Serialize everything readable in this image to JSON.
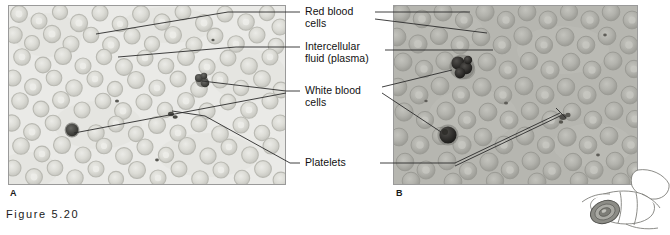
{
  "figure": {
    "caption": "Figure 5.20",
    "panels": [
      {
        "id": "A",
        "letter": "A",
        "description": "blood smear low magnification"
      },
      {
        "id": "B",
        "letter": "B",
        "description": "blood smear high magnification"
      }
    ]
  },
  "labels": [
    {
      "id": "red-blood-cells",
      "text": "Red blood\ncells"
    },
    {
      "id": "intercellular-fluid",
      "text": "Intercellular\nfluid (plasma)"
    },
    {
      "id": "white-blood-cells",
      "text": "White blood\ncells"
    },
    {
      "id": "platelets",
      "text": "Platelets"
    }
  ],
  "colors": {
    "panel_a_background": "#e9e9e6",
    "panel_a_cell": "#cfcfc9",
    "panel_b_background": "#b8b8b2",
    "panel_b_cell": "#a6a6a0",
    "dark_cell": "#3a3a38",
    "leader_line": "#2b2b2b",
    "frame": "#9a9a9a",
    "text": "#111111",
    "caption": "#1a1a1a"
  },
  "layout": {
    "panel_a": {
      "x": 8,
      "y": 5,
      "w": 278,
      "h": 180
    },
    "panel_b": {
      "x": 393,
      "y": 5,
      "w": 245,
      "h": 180
    },
    "caption_pos": {
      "x": 6,
      "y": 210
    },
    "letter_a_pos": {
      "x": 10,
      "y": 188
    },
    "letter_b_pos": {
      "x": 396,
      "y": 188
    }
  }
}
